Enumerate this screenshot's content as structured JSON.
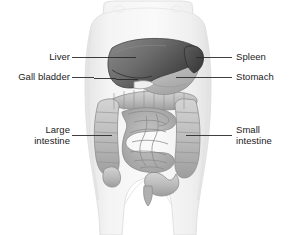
{
  "figure": {
    "background_color": "#ffffff",
    "body_fill_color": "#f1f1f1",
    "body_outline_color": "#dcdcdc",
    "liver_color": "#6b6b6b",
    "stomach_color": "#b3b3b3",
    "spleen_color": "#4f4f4f",
    "gallbladder_color": "#e8e8e8",
    "intestine_color": "#bdbdbd",
    "label_color": "#1b1b1b",
    "leader_color": "#2a2a2a"
  },
  "labels": {
    "liver": "Liver",
    "gall_bladder": "Gall bladder",
    "large_intestine": "Large\nintestine",
    "spleen": "Spleen",
    "stomach": "Stomach",
    "small_intestine": "Small\nintestine"
  },
  "organs": [
    {
      "name": "liver",
      "label": "Liver",
      "side": "left"
    },
    {
      "name": "gall-bladder",
      "label": "Gall bladder",
      "side": "left"
    },
    {
      "name": "large-intestine",
      "label": "Large intestine",
      "side": "left"
    },
    {
      "name": "spleen",
      "label": "Spleen",
      "side": "right"
    },
    {
      "name": "stomach",
      "label": "Stomach",
      "side": "right"
    },
    {
      "name": "small-intestine",
      "label": "Small intestine",
      "side": "right"
    }
  ]
}
